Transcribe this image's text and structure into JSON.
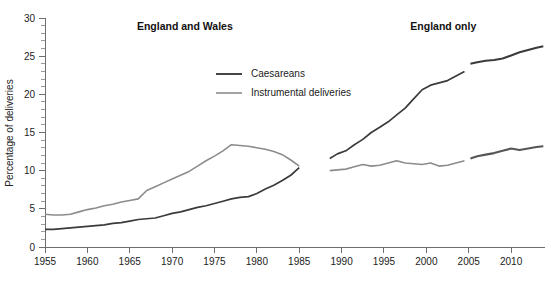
{
  "chart_data": {
    "type": "line",
    "title": "",
    "xlabel": "",
    "ylabel": "Percentage of deliveries",
    "xlim": [
      1955,
      2014
    ],
    "ylim": [
      0,
      30
    ],
    "ytick_step": 5,
    "yminor_step": 1,
    "xtick_step": 5,
    "grid": false,
    "legend_position": "top-center",
    "xticks": [
      "1955",
      "1960",
      "1965",
      "1970",
      "1975",
      "1980",
      "1985",
      "1990",
      "1995",
      "2000",
      "2005",
      "2010"
    ],
    "xtick_values": [
      1955,
      1960,
      1965,
      1970,
      1975,
      1980,
      1985,
      1990,
      1995,
      2000,
      2005,
      2010
    ],
    "yticks": [
      "0",
      "5",
      "10",
      "15",
      "20",
      "25",
      "30"
    ],
    "ytick_values": [
      0,
      5,
      10,
      15,
      20,
      25,
      30
    ],
    "panel_titles": [
      {
        "label": "England and Wales",
        "x": 1971.5
      },
      {
        "label": "England only",
        "x": 2002.0
      }
    ],
    "legend": [
      {
        "name": "Caesareans",
        "color": "#3b3b3b",
        "width": 1.9
      },
      {
        "name": "Instrumental deliveries",
        "color": "#8c8c8c",
        "width": 1.6
      }
    ],
    "series": [
      {
        "name": "Caesareans",
        "panel": "England and Wales",
        "color": "#3b3b3b",
        "width": 1.7,
        "x": [
          1955,
          1956,
          1957,
          1958,
          1959,
          1960,
          1961,
          1962,
          1963,
          1964,
          1965,
          1966,
          1967,
          1968,
          1969,
          1970,
          1971,
          1972,
          1973,
          1974,
          1975,
          1976,
          1977,
          1978,
          1979,
          1980,
          1981,
          1982,
          1983,
          1984,
          1985
        ],
        "values": [
          2.3,
          2.3,
          2.4,
          2.5,
          2.6,
          2.7,
          2.8,
          2.9,
          3.1,
          3.2,
          3.4,
          3.6,
          3.7,
          3.8,
          4.1,
          4.4,
          4.6,
          4.9,
          5.2,
          5.4,
          5.7,
          6.0,
          6.3,
          6.5,
          6.6,
          7.0,
          7.6,
          8.1,
          8.7,
          9.4,
          10.4
        ]
      },
      {
        "name": "Instrumental deliveries",
        "panel": "England and Wales",
        "color": "#8c8c8c",
        "width": 1.6,
        "x": [
          1955,
          1956,
          1957,
          1958,
          1959,
          1960,
          1961,
          1962,
          1963,
          1964,
          1965,
          1966,
          1967,
          1968,
          1969,
          1970,
          1971,
          1972,
          1973,
          1974,
          1975,
          1976,
          1977,
          1978,
          1979,
          1980,
          1981,
          1982,
          1983,
          1984,
          1985
        ],
        "values": [
          4.3,
          4.2,
          4.2,
          4.3,
          4.6,
          4.9,
          5.1,
          5.4,
          5.6,
          5.9,
          6.1,
          6.3,
          7.4,
          7.9,
          8.4,
          8.9,
          9.4,
          9.9,
          10.6,
          11.3,
          11.9,
          12.6,
          13.4,
          13.3,
          13.2,
          13.0,
          12.8,
          12.5,
          12.1,
          11.4,
          10.6
        ]
      },
      {
        "name": "Caesareans",
        "panel": "England only",
        "color": "#3b3b3b",
        "width": 1.7,
        "x": [
          1988.6,
          1989.5,
          1990.5,
          1991.5,
          1992.5,
          1993.5,
          1994.5,
          1995.5,
          1996.5,
          1997.5,
          1998.5,
          1999.5,
          2000.5,
          2001.5,
          2002.5,
          2003.5,
          2004.5
        ],
        "values": [
          11.6,
          12.2,
          12.6,
          13.4,
          14.1,
          15.0,
          15.7,
          16.4,
          17.3,
          18.2,
          19.4,
          20.6,
          21.2,
          21.5,
          21.8,
          22.4,
          23.0
        ]
      },
      {
        "name": "Caesareans",
        "panel": "England only",
        "color": "#3b3b3b",
        "width": 2.1,
        "x": [
          2005.2,
          2006,
          2007,
          2008,
          2009,
          2010,
          2011,
          2012,
          2013,
          2013.8
        ],
        "values": [
          24.0,
          24.2,
          24.4,
          24.5,
          24.7,
          25.1,
          25.5,
          25.8,
          26.1,
          26.3
        ]
      },
      {
        "name": "Instrumental deliveries",
        "panel": "England only",
        "color": "#8c8c8c",
        "width": 1.6,
        "x": [
          1988.6,
          1989.5,
          1990.5,
          1991.5,
          1992.5,
          1993.5,
          1994.5,
          1995.5,
          1996.5,
          1997.5,
          1998.5,
          1999.5,
          2000.5,
          2001.5,
          2002.5,
          2003.5,
          2004.5
        ],
        "values": [
          10.0,
          10.1,
          10.2,
          10.5,
          10.8,
          10.6,
          10.7,
          11.0,
          11.3,
          11.0,
          10.9,
          10.8,
          11.0,
          10.6,
          10.7,
          11.0,
          11.3
        ]
      },
      {
        "name": "Instrumental deliveries",
        "panel": "England only",
        "color": "#555555",
        "width": 2.1,
        "x": [
          2005.2,
          2006,
          2007,
          2008,
          2009,
          2010,
          2011,
          2012,
          2013,
          2013.8
        ],
        "values": [
          11.6,
          11.9,
          12.1,
          12.3,
          12.6,
          12.9,
          12.7,
          12.9,
          13.1,
          13.2
        ]
      }
    ],
    "annotations": [
      {
        "text": "panel break between England and Wales series (ends 1985) and England only series (starts 1988/89)"
      }
    ]
  }
}
